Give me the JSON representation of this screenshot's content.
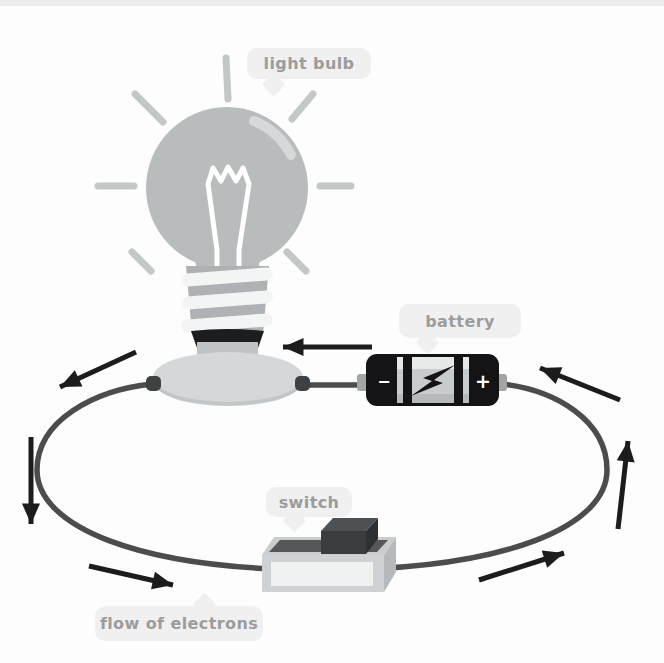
{
  "labels": {
    "light_bulb": "light bulb",
    "battery": "battery",
    "switch": "switch",
    "flow_of_electrons": "flow of electrons"
  },
  "battery": {
    "negative_symbol": "−",
    "positive_symbol": "+"
  },
  "colors": {
    "wire": "#4c4c4c",
    "arrow": "#1c1c1c",
    "bulb_glass": "#b9bcbd",
    "bulb_rays": "#c4c7c8",
    "filament": "#ffffff",
    "battery_body": "#141416",
    "battery_panel": "#c8cccd",
    "switch_body": "#ced2d4",
    "switch_button": "#393d40",
    "bubble_background": "#f0f0f1",
    "bubble_text": "#9c9c9c"
  }
}
